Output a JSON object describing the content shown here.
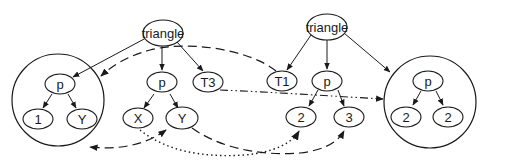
{
  "diagram": {
    "nodes": [
      {
        "id": "tri_left",
        "label": "triangle"
      },
      {
        "id": "lc_p",
        "label": "p"
      },
      {
        "id": "lc_1",
        "label": "1"
      },
      {
        "id": "lc_y",
        "label": "Y"
      },
      {
        "id": "ml_p",
        "label": "p"
      },
      {
        "id": "ml_x",
        "label": "X"
      },
      {
        "id": "ml_y",
        "label": "Y"
      },
      {
        "id": "ml_t3",
        "label": "T3"
      },
      {
        "id": "tri_right",
        "label": "triangle"
      },
      {
        "id": "mr_t1",
        "label": "T1"
      },
      {
        "id": "mr_p",
        "label": "p"
      },
      {
        "id": "mr_2",
        "label": "2"
      },
      {
        "id": "mr_3",
        "label": "3"
      },
      {
        "id": "rc_p",
        "label": "p"
      },
      {
        "id": "rc_2a",
        "label": "2"
      },
      {
        "id": "rc_2b",
        "label": "2"
      }
    ],
    "groups": [
      {
        "id": "left_circle",
        "members": [
          "lc_p",
          "lc_1",
          "lc_y"
        ]
      },
      {
        "id": "right_circle",
        "members": [
          "rc_p",
          "rc_2a",
          "rc_2b"
        ]
      }
    ],
    "edges": [
      {
        "from": "tri_left",
        "to": "left_circle",
        "style": "solid"
      },
      {
        "from": "tri_left",
        "to": "ml_p",
        "style": "solid"
      },
      {
        "from": "tri_left",
        "to": "ml_t3",
        "style": "solid"
      },
      {
        "from": "lc_p",
        "to": "lc_1",
        "style": "solid"
      },
      {
        "from": "lc_p",
        "to": "lc_y",
        "style": "solid"
      },
      {
        "from": "ml_p",
        "to": "ml_x",
        "style": "solid"
      },
      {
        "from": "ml_p",
        "to": "ml_y",
        "style": "solid"
      },
      {
        "from": "tri_right",
        "to": "mr_t1",
        "style": "solid"
      },
      {
        "from": "tri_right",
        "to": "mr_p",
        "style": "solid"
      },
      {
        "from": "tri_right",
        "to": "right_circle",
        "style": "solid"
      },
      {
        "from": "mr_p",
        "to": "mr_2",
        "style": "solid"
      },
      {
        "from": "mr_p",
        "to": "mr_3",
        "style": "solid"
      },
      {
        "from": "rc_p",
        "to": "rc_2a",
        "style": "solid"
      },
      {
        "from": "rc_p",
        "to": "rc_2b",
        "style": "solid"
      },
      {
        "from": "mr_t1",
        "to": "left_circle",
        "style": "dashed"
      },
      {
        "from": "ml_y",
        "to": "left_circle",
        "style": "dashed"
      },
      {
        "from": "ml_y",
        "to": "mr_3",
        "style": "dashed"
      },
      {
        "from": "ml_x",
        "to": "mr_2",
        "style": "dotted"
      },
      {
        "from": "ml_t3",
        "to": "right_circle",
        "style": "dash-dot"
      }
    ]
  }
}
